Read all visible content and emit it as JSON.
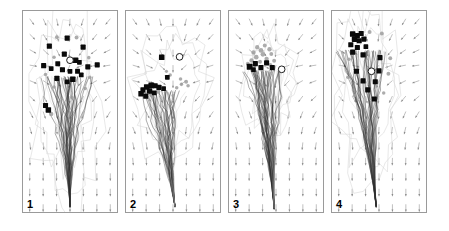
{
  "figure": {
    "width": 449,
    "height": 231,
    "background": "#ffffff",
    "panel_count": 4,
    "panel_border_color": "#9a9a9a",
    "caption_text": ""
  },
  "colors": {
    "arrow": "#8a8a8a",
    "trajectory_dark": "#2b2b2b",
    "trajectory_light": "#b9b9b9",
    "contour": "#d8d8d8",
    "marker_black": "#0a0a0a",
    "marker_gray": "#9e9e9e",
    "marker_open_fill": "#ffffff",
    "marker_open_stroke": "#1a1a1a",
    "frame": "#9a9a9a"
  },
  "panels": [
    {
      "id": "panel-1",
      "label": "1",
      "x": 22,
      "width": 96,
      "field": {
        "type": "converging-radial",
        "focus_x": 0.47,
        "focus_y": 0.3,
        "cols": 7,
        "rows": 13,
        "arrow_len": 7.5
      },
      "plume": {
        "origin_x": 0.46,
        "origin_y": 0.33,
        "tip_x": 0.5,
        "tip_y": 0.97,
        "spread": 0.16,
        "strands": 46,
        "seed": 11
      },
      "contour": {
        "cx": 0.46,
        "cy": 0.45,
        "rx": 0.24,
        "ry": 0.34,
        "seed": 3
      },
      "markers_black": [
        {
          "x": 0.47,
          "y": 0.135,
          "shape": "square",
          "r": 2.6
        },
        {
          "x": 0.28,
          "y": 0.175,
          "shape": "square",
          "r": 2.6
        },
        {
          "x": 0.64,
          "y": 0.18,
          "shape": "square",
          "r": 2.6
        },
        {
          "x": 0.44,
          "y": 0.215,
          "shape": "square",
          "r": 2.6
        },
        {
          "x": 0.56,
          "y": 0.245,
          "shape": "square",
          "r": 2.8
        },
        {
          "x": 0.6,
          "y": 0.255,
          "shape": "square",
          "r": 2.4
        },
        {
          "x": 0.37,
          "y": 0.262,
          "shape": "square",
          "r": 2.5
        },
        {
          "x": 0.22,
          "y": 0.272,
          "shape": "square",
          "r": 2.6
        },
        {
          "x": 0.3,
          "y": 0.286,
          "shape": "square",
          "r": 2.4
        },
        {
          "x": 0.42,
          "y": 0.292,
          "shape": "square",
          "r": 2.6
        },
        {
          "x": 0.5,
          "y": 0.3,
          "shape": "square",
          "r": 2.4
        },
        {
          "x": 0.58,
          "y": 0.3,
          "shape": "square",
          "r": 2.5
        },
        {
          "x": 0.69,
          "y": 0.278,
          "shape": "square",
          "r": 2.6
        },
        {
          "x": 0.79,
          "y": 0.268,
          "shape": "square",
          "r": 2.6
        },
        {
          "x": 0.36,
          "y": 0.335,
          "shape": "square",
          "r": 2.6
        },
        {
          "x": 0.53,
          "y": 0.34,
          "shape": "square",
          "r": 2.8
        },
        {
          "x": 0.47,
          "y": 0.352,
          "shape": "square",
          "r": 2.4
        },
        {
          "x": 0.62,
          "y": 0.318,
          "shape": "square",
          "r": 2.4
        },
        {
          "x": 0.24,
          "y": 0.47,
          "shape": "square",
          "r": 2.6
        },
        {
          "x": 0.27,
          "y": 0.492,
          "shape": "square",
          "r": 2.8
        }
      ],
      "markers_gray": [
        {
          "x": 0.36,
          "y": 0.13,
          "r": 2.0
        },
        {
          "x": 0.57,
          "y": 0.132,
          "r": 2.0
        },
        {
          "x": 0.33,
          "y": 0.23,
          "r": 1.8
        },
        {
          "x": 0.7,
          "y": 0.232,
          "r": 1.8
        },
        {
          "x": 0.24,
          "y": 0.316,
          "r": 1.8
        },
        {
          "x": 0.71,
          "y": 0.33,
          "r": 1.8
        },
        {
          "x": 0.33,
          "y": 0.378,
          "r": 1.8
        },
        {
          "x": 0.66,
          "y": 0.385,
          "r": 1.8
        },
        {
          "x": 0.3,
          "y": 0.512,
          "r": 2.2
        },
        {
          "x": 0.52,
          "y": 0.43,
          "r": 1.8
        }
      ],
      "marker_open": {
        "x": 0.5,
        "y": 0.245,
        "r": 3.4
      }
    },
    {
      "id": "panel-2",
      "label": "2",
      "x": 125,
      "width": 96,
      "field": {
        "type": "converging-radial",
        "focus_x": 0.5,
        "focus_y": 0.33,
        "cols": 7,
        "rows": 13,
        "arrow_len": 7.5
      },
      "plume": {
        "origin_x": 0.36,
        "origin_y": 0.4,
        "tip_x": 0.52,
        "tip_y": 0.97,
        "spread": 0.13,
        "strands": 44,
        "seed": 27
      },
      "contour": {
        "cx": 0.48,
        "cy": 0.42,
        "rx": 0.28,
        "ry": 0.22,
        "seed": 7
      },
      "markers_black": [
        {
          "x": 0.38,
          "y": 0.23,
          "shape": "square",
          "r": 2.8
        },
        {
          "x": 0.44,
          "y": 0.33,
          "shape": "square",
          "r": 2.4
        },
        {
          "x": 0.27,
          "y": 0.37,
          "shape": "square",
          "r": 3.0
        },
        {
          "x": 0.22,
          "y": 0.378,
          "shape": "square",
          "r": 2.8
        },
        {
          "x": 0.31,
          "y": 0.372,
          "shape": "square",
          "r": 2.6
        },
        {
          "x": 0.35,
          "y": 0.38,
          "shape": "square",
          "r": 2.6
        },
        {
          "x": 0.18,
          "y": 0.392,
          "shape": "square",
          "r": 2.6
        },
        {
          "x": 0.25,
          "y": 0.398,
          "shape": "square",
          "r": 2.8
        },
        {
          "x": 0.4,
          "y": 0.386,
          "shape": "square",
          "r": 2.4
        },
        {
          "x": 0.16,
          "y": 0.412,
          "shape": "square",
          "r": 2.8
        },
        {
          "x": 0.3,
          "y": 0.408,
          "shape": "square",
          "r": 2.4
        },
        {
          "x": 0.21,
          "y": 0.424,
          "shape": "square",
          "r": 2.6
        }
      ],
      "markers_gray": [
        {
          "x": 0.47,
          "y": 0.318,
          "r": 1.8
        },
        {
          "x": 0.58,
          "y": 0.338,
          "r": 1.8
        },
        {
          "x": 0.64,
          "y": 0.352,
          "r": 2.0
        },
        {
          "x": 0.59,
          "y": 0.365,
          "r": 1.8
        },
        {
          "x": 0.66,
          "y": 0.372,
          "r": 1.8
        },
        {
          "x": 0.54,
          "y": 0.382,
          "r": 1.8
        },
        {
          "x": 0.34,
          "y": 0.4,
          "r": 2.4
        },
        {
          "x": 0.27,
          "y": 0.418,
          "r": 2.2
        },
        {
          "x": 0.43,
          "y": 0.3,
          "r": 1.6
        },
        {
          "x": 0.5,
          "y": 0.42,
          "r": 1.6
        }
      ],
      "marker_open": {
        "x": 0.57,
        "y": 0.228,
        "r": 3.4
      }
    },
    {
      "id": "panel-3",
      "label": "3",
      "x": 228,
      "width": 96,
      "field": {
        "type": "converging-radial",
        "focus_x": 0.48,
        "focus_y": 0.3,
        "cols": 7,
        "rows": 13,
        "arrow_len": 7.5
      },
      "plume": {
        "origin_x": 0.4,
        "origin_y": 0.3,
        "tip_x": 0.48,
        "tip_y": 0.98,
        "spread": 0.11,
        "strands": 48,
        "seed": 41
      },
      "contour": {
        "cx": 0.44,
        "cy": 0.36,
        "rx": 0.2,
        "ry": 0.18,
        "seed": 13
      },
      "markers_black": [
        {
          "x": 0.28,
          "y": 0.262,
          "shape": "square",
          "r": 2.6
        },
        {
          "x": 0.4,
          "y": 0.258,
          "shape": "square",
          "r": 2.6
        },
        {
          "x": 0.22,
          "y": 0.278,
          "shape": "square",
          "r": 3.0
        },
        {
          "x": 0.34,
          "y": 0.282,
          "shape": "square",
          "r": 2.6
        },
        {
          "x": 0.46,
          "y": 0.282,
          "shape": "square",
          "r": 2.6
        },
        {
          "x": 0.26,
          "y": 0.292,
          "shape": "square",
          "r": 2.4
        }
      ],
      "markers_gray": [
        {
          "x": 0.3,
          "y": 0.18,
          "r": 2.2
        },
        {
          "x": 0.38,
          "y": 0.172,
          "r": 2.0
        },
        {
          "x": 0.34,
          "y": 0.196,
          "r": 2.4
        },
        {
          "x": 0.43,
          "y": 0.19,
          "r": 2.2
        },
        {
          "x": 0.26,
          "y": 0.206,
          "r": 2.2
        },
        {
          "x": 0.36,
          "y": 0.216,
          "r": 2.4
        },
        {
          "x": 0.45,
          "y": 0.214,
          "r": 2.0
        },
        {
          "x": 0.29,
          "y": 0.23,
          "r": 2.4
        },
        {
          "x": 0.4,
          "y": 0.238,
          "r": 2.2
        },
        {
          "x": 0.24,
          "y": 0.246,
          "r": 2.2
        },
        {
          "x": 0.33,
          "y": 0.252,
          "r": 2.0
        },
        {
          "x": 0.48,
          "y": 0.248,
          "r": 2.0
        },
        {
          "x": 0.2,
          "y": 0.262,
          "r": 2.0
        },
        {
          "x": 0.44,
          "y": 0.268,
          "r": 2.0
        },
        {
          "x": 0.3,
          "y": 0.31,
          "r": 1.8
        }
      ],
      "marker_open": {
        "x": 0.56,
        "y": 0.29,
        "r": 3.4
      }
    },
    {
      "id": "panel-4",
      "label": "4",
      "x": 331,
      "width": 96,
      "field": {
        "type": "converging-radial",
        "focus_x": 0.45,
        "focus_y": 0.3,
        "cols": 7,
        "rows": 13,
        "arrow_len": 7.5
      },
      "plume": {
        "origin_x": 0.3,
        "origin_y": 0.2,
        "tip_x": 0.47,
        "tip_y": 0.97,
        "spread": 0.14,
        "strands": 50,
        "seed": 59
      },
      "contour": {
        "cx": 0.38,
        "cy": 0.42,
        "rx": 0.24,
        "ry": 0.3,
        "seed": 19
      },
      "markers_black": [
        {
          "x": 0.22,
          "y": 0.115,
          "shape": "square",
          "r": 2.8
        },
        {
          "x": 0.27,
          "y": 0.122,
          "shape": "square",
          "r": 2.6
        },
        {
          "x": 0.31,
          "y": 0.112,
          "shape": "square",
          "r": 2.6
        },
        {
          "x": 0.24,
          "y": 0.14,
          "shape": "square",
          "r": 2.8
        },
        {
          "x": 0.29,
          "y": 0.148,
          "shape": "square",
          "r": 2.6
        },
        {
          "x": 0.34,
          "y": 0.14,
          "shape": "square",
          "r": 2.6
        },
        {
          "x": 0.2,
          "y": 0.168,
          "shape": "square",
          "r": 2.6
        },
        {
          "x": 0.27,
          "y": 0.182,
          "shape": "square",
          "r": 2.6
        },
        {
          "x": 0.36,
          "y": 0.178,
          "shape": "square",
          "r": 2.4
        },
        {
          "x": 0.22,
          "y": 0.205,
          "shape": "square",
          "r": 2.6
        },
        {
          "x": 0.33,
          "y": 0.218,
          "shape": "square",
          "r": 2.6
        },
        {
          "x": 0.51,
          "y": 0.232,
          "shape": "square",
          "r": 2.6
        },
        {
          "x": 0.26,
          "y": 0.3,
          "shape": "square",
          "r": 2.6
        },
        {
          "x": 0.5,
          "y": 0.298,
          "shape": "square",
          "r": 2.6
        },
        {
          "x": 0.33,
          "y": 0.348,
          "shape": "square",
          "r": 2.6
        },
        {
          "x": 0.46,
          "y": 0.352,
          "shape": "square",
          "r": 2.6
        },
        {
          "x": 0.38,
          "y": 0.392,
          "shape": "square",
          "r": 2.6
        },
        {
          "x": 0.45,
          "y": 0.438,
          "shape": "square",
          "r": 2.6
        }
      ],
      "markers_gray": [
        {
          "x": 0.4,
          "y": 0.105,
          "r": 2.0
        },
        {
          "x": 0.53,
          "y": 0.112,
          "r": 2.0
        },
        {
          "x": 0.18,
          "y": 0.24,
          "r": 1.8
        },
        {
          "x": 0.62,
          "y": 0.235,
          "r": 2.0
        },
        {
          "x": 0.6,
          "y": 0.312,
          "r": 2.0
        },
        {
          "x": 0.17,
          "y": 0.33,
          "r": 1.8
        },
        {
          "x": 0.24,
          "y": 0.42,
          "r": 1.8
        },
        {
          "x": 0.55,
          "y": 0.408,
          "r": 1.8
        }
      ],
      "marker_open": {
        "x": 0.42,
        "y": 0.3,
        "r": 3.4
      }
    }
  ],
  "chart_data": {
    "type": "scatter",
    "title": "",
    "xlabel": "",
    "ylabel": "",
    "panel_labels": [
      "1",
      "2",
      "3",
      "4"
    ],
    "legend": [],
    "grid": false
  }
}
